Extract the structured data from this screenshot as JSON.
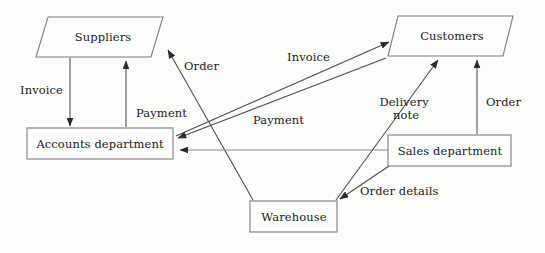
{
  "diagram": {
    "type": "data-flow-diagram",
    "background_color": "#fdfdfc",
    "node_fill_color": "#fefefe",
    "node_stroke_color": "#7d7d7d",
    "line_color": "#4a4a4a",
    "text_color": "#1b1b1b"
  },
  "nodes": [
    {
      "id": "suppliers",
      "label": "Suppliers",
      "shape": "parallelogram",
      "role": "external-entity",
      "x": 36,
      "y": 17,
      "width": 127,
      "height": 40,
      "skew": 12,
      "label_x": 103,
      "label_y": 41
    },
    {
      "id": "customers",
      "label": "Customers",
      "shape": "parallelogram",
      "role": "external-entity",
      "x": 388,
      "y": 16,
      "width": 125,
      "height": 40,
      "skew": 10,
      "label_x": 452,
      "label_y": 40
    },
    {
      "id": "accounts-department",
      "label": "Accounts department",
      "shape": "rectangle",
      "role": "process",
      "x": 27,
      "y": 128,
      "width": 146,
      "height": 31,
      "label_x": 100,
      "label_y": 148
    },
    {
      "id": "sales-department",
      "label": "Sales department",
      "shape": "rectangle",
      "role": "process",
      "x": 388,
      "y": 135,
      "width": 123,
      "height": 31,
      "label_x": 450,
      "label_y": 155
    },
    {
      "id": "warehouse",
      "label": "Warehouse",
      "shape": "rectangle",
      "role": "process",
      "x": 250,
      "y": 201,
      "width": 87,
      "height": 31,
      "label_x": 294,
      "label_y": 221
    }
  ],
  "flows": [
    {
      "id": "flow-invoice-suppliers-accounts",
      "label": "Invoice",
      "from": "suppliers",
      "to": "accounts-department",
      "path": "M 70 58 L 70 126",
      "arrow_at": "end",
      "label_x": 20,
      "label_y": 94,
      "label_anchor": "start"
    },
    {
      "id": "flow-payment-accounts-suppliers",
      "label": "Payment",
      "from": "accounts-department",
      "to": "suppliers",
      "path": "M 126 127 L 126 61",
      "arrow_at": "end",
      "label_x": 136,
      "label_y": 117,
      "label_anchor": "start"
    },
    {
      "id": "flow-order-warehouse-suppliers",
      "label": "Order",
      "from": "warehouse",
      "to": "suppliers",
      "path": "M 253 200 L 168 50",
      "arrow_at": "end",
      "label_x": 184,
      "label_y": 70,
      "label_anchor": "start"
    },
    {
      "id": "flow-invoice-accounts-customers",
      "label": "Invoice",
      "from": "accounts-department",
      "to": "customers",
      "path": "M 176 136 L 389 42",
      "arrow_at": "end",
      "label_x": 287,
      "label_y": 61,
      "label_anchor": "start"
    },
    {
      "id": "flow-payment-customers-accounts",
      "label": "Payment",
      "from": "customers",
      "to": "accounts-department",
      "path": "M 386 58 L 178 138",
      "arrow_at": "end",
      "label_x": 253,
      "label_y": 124,
      "label_anchor": "start"
    },
    {
      "id": "flow-payment-sales-accounts",
      "label": "",
      "from": "sales-department",
      "to": "accounts-department",
      "path": "M 388 150 L 180 150",
      "arrow_at": "end",
      "label_x": 0,
      "label_y": 0,
      "label_anchor": "start"
    },
    {
      "id": "flow-delivery-note-warehouse-customers",
      "label_line1": "Delivery",
      "label_line2": "note",
      "label": "Delivery note",
      "from": "warehouse",
      "to": "customers",
      "path": "M 336 200 L 438 60",
      "arrow_at": "end",
      "label_x": 406,
      "label_y": 106,
      "label_anchor": "middle"
    },
    {
      "id": "flow-order-sales-customers",
      "label": "Order",
      "from": "sales-department",
      "to": "customers",
      "path": "M 477 134 L 477 60",
      "arrow_at": "end",
      "label_x": 486,
      "label_y": 106,
      "label_anchor": "start"
    },
    {
      "id": "flow-order-details-sales-warehouse",
      "label": "Order details",
      "from": "sales-department",
      "to": "warehouse",
      "path": "M 389 166 L 340 199",
      "arrow_at": "end",
      "label_x": 360,
      "label_y": 195,
      "label_anchor": "start"
    }
  ]
}
